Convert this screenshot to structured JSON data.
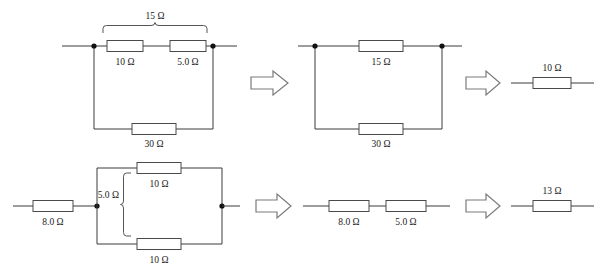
{
  "figure": {
    "background_color": "#ffffff",
    "line_color": "#3a3a3a",
    "text_color": "#1b1b1b",
    "ohm_symbol": "Ω"
  },
  "rows": [
    {
      "name": "top-row",
      "steps": [
        {
          "name": "top-step-1",
          "labels": {
            "brace_total": "15 Ω",
            "r_top_left": "10 Ω",
            "r_top_right": "5.0 Ω",
            "r_bottom": "30 Ω"
          }
        },
        {
          "name": "top-step-2",
          "labels": {
            "r_top": "15 Ω",
            "r_bottom": "30 Ω"
          }
        },
        {
          "name": "top-step-3",
          "labels": {
            "r_result": "10 Ω"
          }
        }
      ]
    },
    {
      "name": "bottom-row",
      "steps": [
        {
          "name": "bottom-step-1",
          "labels": {
            "r_series": "8.0 Ω",
            "brace_parallel": "5.0 Ω",
            "r_parallel_top": "10 Ω",
            "r_parallel_bottom": "10 Ω"
          }
        },
        {
          "name": "bottom-step-2",
          "labels": {
            "r_left": "8.0 Ω",
            "r_right": "5.0 Ω"
          }
        },
        {
          "name": "bottom-step-3",
          "labels": {
            "r_result": "13 Ω"
          }
        }
      ]
    }
  ],
  "arrows": [
    {
      "name": "arrow-top-1",
      "glyph": "right-block-arrow"
    },
    {
      "name": "arrow-top-2",
      "glyph": "right-block-arrow"
    },
    {
      "name": "arrow-bottom-1",
      "glyph": "right-block-arrow"
    },
    {
      "name": "arrow-bottom-2",
      "glyph": "right-block-arrow"
    }
  ]
}
